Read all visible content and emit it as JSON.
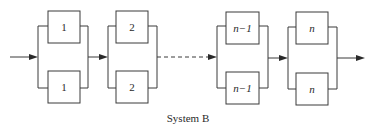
{
  "diagram": {
    "caption": "System B",
    "stages": [
      {
        "top_label": "1",
        "bottom_label": "1",
        "italic": false
      },
      {
        "top_label": "2",
        "bottom_label": "2",
        "italic": false
      },
      {
        "top_label": "n−1",
        "bottom_label": "n−1",
        "italic": true
      },
      {
        "top_label": "n",
        "bottom_label": "n",
        "italic": true
      }
    ],
    "connections": [
      {
        "from": "input",
        "to": "stage-1",
        "style": "solid-arrow"
      },
      {
        "from": "stage-1",
        "to": "stage-2",
        "style": "solid-arrow"
      },
      {
        "from": "stage-2",
        "to": "stage-n-1",
        "style": "dashed-arrow"
      },
      {
        "from": "stage-n-1",
        "to": "stage-n",
        "style": "solid-arrow"
      },
      {
        "from": "stage-n",
        "to": "output",
        "style": "solid-arrow"
      }
    ]
  }
}
